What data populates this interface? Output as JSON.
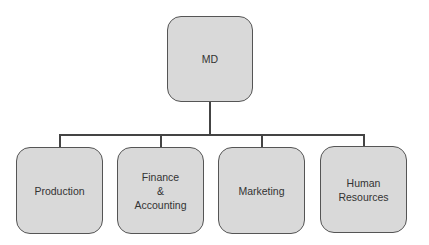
{
  "diagram": {
    "type": "org-chart",
    "root": {
      "label": "MD"
    },
    "children": [
      {
        "label": "Production"
      },
      {
        "label": "Finance\n&\nAccounting"
      },
      {
        "label": "Marketing"
      },
      {
        "label": "Human\nResources"
      }
    ],
    "colors": {
      "box_fill": "#d9d9d9",
      "box_border": "#555555",
      "connector": "#444444",
      "text": "#333333"
    }
  }
}
